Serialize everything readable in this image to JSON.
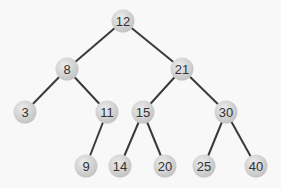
{
  "diagram": {
    "type": "binary-tree",
    "nodes": [
      {
        "id": "n12",
        "label": "12",
        "x": 123,
        "y": 21
      },
      {
        "id": "n8",
        "label": "8",
        "x": 67,
        "y": 69
      },
      {
        "id": "n21",
        "label": "21",
        "x": 182,
        "y": 69
      },
      {
        "id": "n3",
        "label": "3",
        "x": 25,
        "y": 112
      },
      {
        "id": "n11",
        "label": "11",
        "x": 107,
        "y": 112
      },
      {
        "id": "n15",
        "label": "15",
        "x": 143,
        "y": 112
      },
      {
        "id": "n30",
        "label": "30",
        "x": 226,
        "y": 112
      },
      {
        "id": "n9",
        "label": "9",
        "x": 86,
        "y": 166
      },
      {
        "id": "n14",
        "label": "14",
        "x": 120,
        "y": 166
      },
      {
        "id": "n20",
        "label": "20",
        "x": 165,
        "y": 166
      },
      {
        "id": "n25",
        "label": "25",
        "x": 204,
        "y": 166
      },
      {
        "id": "n40",
        "label": "40",
        "x": 256,
        "y": 166
      }
    ],
    "edges": [
      [
        "n12",
        "n8"
      ],
      [
        "n12",
        "n21"
      ],
      [
        "n8",
        "n3"
      ],
      [
        "n8",
        "n11"
      ],
      [
        "n11",
        "n9"
      ],
      [
        "n21",
        "n15"
      ],
      [
        "n21",
        "n30"
      ],
      [
        "n15",
        "n14"
      ],
      [
        "n15",
        "n20"
      ],
      [
        "n30",
        "n25"
      ],
      [
        "n30",
        "n40"
      ]
    ],
    "colors": {
      "node_fill": "#d0d0d0",
      "node_highlight": "#ececec",
      "edge": "#3a3a3a",
      "text": "#333333",
      "background": "#f8f8f8"
    }
  }
}
